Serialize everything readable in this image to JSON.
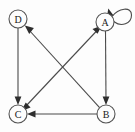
{
  "diagram": {
    "type": "directed-graph",
    "canvas": {
      "width": 135,
      "height": 132,
      "background": "#fdfdfd"
    },
    "style": {
      "node_fill": "#fdfdfd",
      "node_stroke": "#555555",
      "edge_color": "#4a4a4a",
      "arrow_color": "#2e2e2e",
      "label_color": "#1a1a1a",
      "node_radius": 9
    },
    "nodes": [
      {
        "id": "D",
        "label": "D",
        "cx": 18,
        "cy": 19,
        "r": 9
      },
      {
        "id": "A",
        "label": "A",
        "cx": 105,
        "cy": 22,
        "r": 9
      },
      {
        "id": "C",
        "label": "C",
        "cx": 18,
        "cy": 114,
        "r": 9
      },
      {
        "id": "B",
        "label": "B",
        "cx": 106,
        "cy": 114,
        "r": 9
      }
    ],
    "edges": [
      {
        "id": "a-self",
        "from": "A",
        "to": "A",
        "kind": "self-loop",
        "directed": true
      },
      {
        "id": "d-c",
        "from": "D",
        "to": "C",
        "kind": "straight",
        "directed": true
      },
      {
        "id": "a-b",
        "from": "A",
        "to": "B",
        "kind": "straight",
        "directed": true
      },
      {
        "id": "b-c",
        "from": "B",
        "to": "C",
        "kind": "straight",
        "directed": true
      },
      {
        "id": "b-d",
        "from": "B",
        "to": "D",
        "kind": "diagonal",
        "directed": true
      },
      {
        "id": "c-a",
        "from": "C",
        "to": "A",
        "kind": "diagonal",
        "directed": true
      },
      {
        "id": "a-c",
        "from": "A",
        "to": "C",
        "kind": "diagonal",
        "directed": true
      }
    ]
  }
}
